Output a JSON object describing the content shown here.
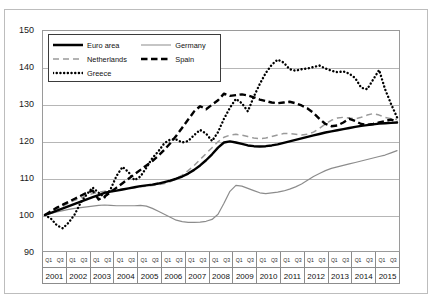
{
  "chart_title": "",
  "legend": {
    "position": "inside-top-left",
    "entries": [
      {
        "label": "Euro area",
        "style": "solid-thick-black",
        "color": "#000000"
      },
      {
        "label": "Germany",
        "style": "solid-thin-gray",
        "color": "#8c8c8c"
      },
      {
        "label": "Netherlands",
        "style": "dashed-gray",
        "color": "#9a9a9a"
      },
      {
        "label": "Spain",
        "style": "dashed-thick-black",
        "color": "#000000"
      },
      {
        "label": "Greece",
        "style": "dotted-black",
        "color": "#000000"
      }
    ]
  },
  "axis": {
    "y_ticks": [
      150,
      140,
      130,
      120,
      110,
      100,
      90
    ],
    "x_quarter_labels": [
      "Q1",
      "Q3"
    ],
    "x_years": [
      "2001",
      "2002",
      "2003",
      "2004",
      "2005",
      "2006",
      "2007",
      "2008",
      "2009",
      "2010",
      "2011",
      "2012",
      "2013",
      "2014",
      "2015"
    ]
  },
  "chart_data": {
    "type": "line",
    "title": "",
    "xlabel": "",
    "ylabel": "",
    "ylim": [
      90,
      150
    ],
    "ytick_step": 10,
    "grid": true,
    "legend_position": "inside-top-left",
    "x_unit": "quarter",
    "x": [
      "2001Q1",
      "2001Q2",
      "2001Q3",
      "2001Q4",
      "2002Q1",
      "2002Q2",
      "2002Q3",
      "2002Q4",
      "2003Q1",
      "2003Q2",
      "2003Q3",
      "2003Q4",
      "2004Q1",
      "2004Q2",
      "2004Q3",
      "2004Q4",
      "2005Q1",
      "2005Q2",
      "2005Q3",
      "2005Q4",
      "2006Q1",
      "2006Q2",
      "2006Q3",
      "2006Q4",
      "2007Q1",
      "2007Q2",
      "2007Q3",
      "2007Q4",
      "2008Q1",
      "2008Q2",
      "2008Q3",
      "2008Q4",
      "2009Q1",
      "2009Q2",
      "2009Q3",
      "2009Q4",
      "2010Q1",
      "2010Q2",
      "2010Q3",
      "2010Q4",
      "2011Q1",
      "2011Q2",
      "2011Q3",
      "2011Q4",
      "2012Q1",
      "2012Q2",
      "2012Q3",
      "2012Q4",
      "2013Q1",
      "2013Q2",
      "2013Q3",
      "2013Q4",
      "2014Q1",
      "2014Q2",
      "2014Q3",
      "2014Q4",
      "2015Q1",
      "2015Q2",
      "2015Q3",
      "2015Q4"
    ],
    "series": [
      {
        "name": "Euro area",
        "color": "#000000",
        "style": "solid-thick-black",
        "values": [
          100.0,
          100.6,
          101.2,
          101.8,
          102.4,
          103.0,
          103.6,
          104.2,
          104.8,
          105.4,
          106.0,
          106.3,
          106.6,
          106.9,
          107.2,
          107.5,
          107.8,
          108.0,
          108.2,
          108.5,
          108.9,
          109.3,
          109.8,
          110.4,
          111.2,
          112.2,
          113.4,
          114.8,
          116.4,
          118.2,
          119.6,
          119.9,
          119.6,
          119.2,
          118.8,
          118.6,
          118.5,
          118.6,
          118.8,
          119.1,
          119.5,
          119.9,
          120.3,
          120.7,
          121.1,
          121.5,
          121.9,
          122.3,
          122.6,
          122.9,
          123.2,
          123.5,
          123.8,
          124.1,
          124.3,
          124.5,
          124.7,
          124.8,
          124.9,
          125.0
        ]
      },
      {
        "name": "Germany",
        "color": "#8c8c8c",
        "style": "solid-thin-gray",
        "values": [
          100.0,
          100.4,
          100.8,
          101.2,
          101.5,
          101.8,
          102.0,
          102.2,
          102.4,
          102.6,
          102.7,
          102.6,
          102.5,
          102.5,
          102.5,
          102.5,
          102.6,
          102.4,
          101.8,
          101.0,
          100.2,
          99.4,
          98.6,
          98.2,
          98.0,
          98.0,
          98.1,
          98.3,
          98.8,
          100.2,
          103.2,
          106.4,
          108.0,
          107.8,
          107.2,
          106.6,
          106.0,
          105.8,
          106.0,
          106.2,
          106.5,
          107.0,
          107.6,
          108.4,
          109.4,
          110.4,
          111.2,
          112.0,
          112.6,
          113.0,
          113.4,
          113.8,
          114.2,
          114.6,
          115.0,
          115.4,
          115.8,
          116.2,
          116.8,
          117.4
        ]
      },
      {
        "name": "Netherlands",
        "color": "#9a9a9a",
        "style": "dashed-gray",
        "values": [
          100.0,
          100.8,
          101.6,
          102.4,
          103.2,
          104.0,
          104.6,
          105.2,
          105.8,
          106.2,
          106.4,
          106.6,
          106.8,
          107.0,
          107.2,
          107.4,
          107.6,
          107.8,
          108.0,
          108.2,
          108.5,
          109.0,
          109.8,
          110.8,
          112.0,
          113.4,
          115.0,
          116.6,
          118.2,
          119.8,
          121.0,
          121.6,
          121.8,
          121.6,
          121.2,
          120.8,
          120.6,
          120.8,
          121.2,
          121.6,
          122.0,
          122.0,
          121.8,
          121.6,
          121.8,
          122.4,
          123.4,
          124.6,
          125.6,
          126.2,
          126.4,
          126.2,
          126.0,
          126.4,
          127.0,
          127.4,
          127.0,
          126.4,
          126.0,
          125.8
        ]
      },
      {
        "name": "Spain",
        "color": "#000000",
        "style": "dashed-thick-black",
        "values": [
          100.0,
          101.0,
          102.0,
          102.8,
          103.6,
          104.4,
          105.2,
          106.0,
          106.6,
          104.2,
          105.0,
          106.2,
          107.4,
          108.6,
          109.8,
          111.0,
          112.2,
          113.4,
          114.6,
          116.0,
          117.6,
          119.4,
          121.4,
          123.6,
          125.8,
          128.0,
          129.4,
          128.6,
          129.8,
          131.0,
          132.8,
          132.2,
          132.4,
          132.6,
          132.3,
          131.8,
          131.2,
          130.8,
          130.4,
          130.2,
          130.4,
          130.6,
          130.2,
          129.6,
          128.8,
          127.6,
          126.0,
          124.6,
          124.0,
          124.2,
          125.0,
          126.0,
          125.4,
          124.6,
          124.4,
          124.6,
          125.0,
          125.4,
          125.8,
          125.2
        ]
      },
      {
        "name": "Greece",
        "color": "#000000",
        "style": "dotted-black",
        "values": [
          100.0,
          99.0,
          97.2,
          96.4,
          98.0,
          100.2,
          103.4,
          105.6,
          107.4,
          106.0,
          104.8,
          107.0,
          110.6,
          113.0,
          111.6,
          109.4,
          110.4,
          112.8,
          115.4,
          117.2,
          119.4,
          120.4,
          120.4,
          119.6,
          120.0,
          121.6,
          123.0,
          122.0,
          120.0,
          122.4,
          126.0,
          129.0,
          131.4,
          130.2,
          128.0,
          132.0,
          135.4,
          138.4,
          140.6,
          142.0,
          141.2,
          139.4,
          139.0,
          139.4,
          139.6,
          140.0,
          140.4,
          139.6,
          139.0,
          138.6,
          138.8,
          138.2,
          137.0,
          134.4,
          134.0,
          136.6,
          139.2,
          134.0,
          130.0,
          126.4
        ]
      }
    ]
  }
}
